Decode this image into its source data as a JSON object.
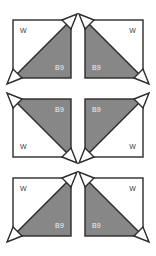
{
  "page": {
    "background_color": "#ffffff",
    "columns": 2,
    "rows": 3
  },
  "style": {
    "fill_gray": "#878787",
    "outline_color": "#2b2b2b",
    "white_fill": "#ffffff",
    "white_label_color": "#3a3a3a",
    "gray_label_color": "#f2f2f2",
    "outline_width": 1.4
  },
  "labels": {
    "white_patch": "W",
    "gray_patch": "B9"
  },
  "blocks": [
    {
      "id": "block-r1c1",
      "row": 1,
      "column": 1,
      "x": 13,
      "y": 20,
      "diagonal": "bottomleft-topright",
      "gray_corner": "bottom-right",
      "white_corner": "top-left",
      "gray_label": "B9",
      "white_label": "W",
      "ear_corners": [
        "bottom-left",
        "top-right"
      ]
    },
    {
      "id": "block-r1c2",
      "row": 1,
      "column": 2,
      "x": 85,
      "y": 20,
      "diagonal": "topleft-bottomright",
      "gray_corner": "bottom-left",
      "white_corner": "top-right",
      "gray_label": "B9",
      "white_label": "W",
      "ear_corners": [
        "top-left",
        "bottom-right"
      ]
    },
    {
      "id": "block-r2c1",
      "row": 2,
      "column": 1,
      "x": 13,
      "y": 99,
      "diagonal": "topleft-bottomright",
      "gray_corner": "top-right",
      "white_corner": "bottom-left",
      "gray_label": "B9",
      "white_label": "W",
      "ear_corners": [
        "top-left",
        "bottom-right"
      ]
    },
    {
      "id": "block-r2c2",
      "row": 2,
      "column": 2,
      "x": 85,
      "y": 99,
      "diagonal": "bottomleft-topright",
      "gray_corner": "top-left",
      "white_corner": "bottom-right",
      "gray_label": "B9",
      "white_label": "W",
      "ear_corners": [
        "bottom-left",
        "top-right"
      ]
    },
    {
      "id": "block-r3c1",
      "row": 3,
      "column": 1,
      "x": 13,
      "y": 178,
      "diagonal": "bottomleft-topright",
      "gray_corner": "bottom-right",
      "white_corner": "top-left",
      "gray_label": "B9",
      "white_label": "W",
      "ear_corners": [
        "bottom-left",
        "top-right"
      ]
    },
    {
      "id": "block-r3c2",
      "row": 3,
      "column": 2,
      "x": 85,
      "y": 178,
      "diagonal": "topleft-bottomright",
      "gray_corner": "bottom-left",
      "white_corner": "top-right",
      "gray_label": "B9",
      "white_label": "W",
      "ear_corners": [
        "top-left",
        "bottom-right"
      ]
    }
  ]
}
